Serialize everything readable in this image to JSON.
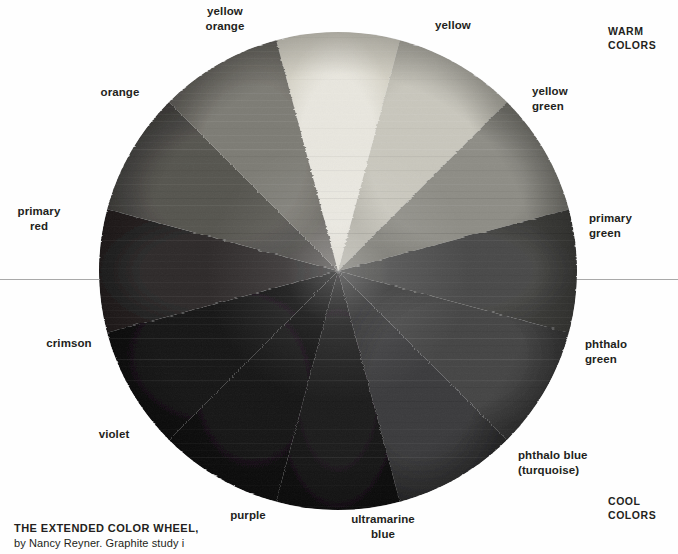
{
  "plate": {
    "background": "#fefefe",
    "rule_color": "#9a9a9a",
    "rule_y": 279
  },
  "caption": {
    "line1": "THE EXTENDED COLOR WHEEL,",
    "line2": "by Nancy Reyner. Graphite study i"
  },
  "groups": {
    "warm": "WARM\nCOLORS",
    "cool": "COOL\nCOLORS"
  },
  "chart_data": {
    "type": "pie",
    "title": "THE EXTENDED COLOR WHEEL,",
    "xlabel": "",
    "ylabel": "",
    "grid": false,
    "legend_position": "around-wheel",
    "center_x": 338,
    "center_y": 271,
    "radius": 240,
    "segment_count": 12,
    "segment_degrees": 30,
    "note": "Grayscale reproduction of a painted 12-hue color wheel; values are rendered tones.",
    "categories": [
      "yellow",
      "yellow green",
      "primary green",
      "phthalo green",
      "phthalo blue (turquoise)",
      "ultramarine blue",
      "purple",
      "violet",
      "crimson",
      "primary red",
      "orange",
      "yellow orange"
    ],
    "values": [
      30,
      30,
      30,
      30,
      30,
      30,
      30,
      30,
      30,
      30,
      30,
      30
    ],
    "segments": [
      {
        "label": "yellow",
        "start_deg": -15,
        "end_deg": 15,
        "tone": "#e9e7df",
        "tone_edge": "#d6d3c7"
      },
      {
        "label": "yellow green",
        "start_deg": 15,
        "end_deg": 45,
        "tone": "#c9c7bd",
        "tone_edge": "#b2b0a6"
      },
      {
        "label": "primary green",
        "start_deg": 45,
        "end_deg": 75,
        "tone": "#8e8d86",
        "tone_edge": "#76756e"
      },
      {
        "label": "phthalo green",
        "start_deg": 75,
        "end_deg": 105,
        "tone": "#4a4a48",
        "tone_edge": "#3a3a38"
      },
      {
        "label": "phthalo blue (turquoise)",
        "start_deg": 105,
        "end_deg": 135,
        "tone": "#454545",
        "tone_edge": "#343434"
      },
      {
        "label": "ultramarine blue",
        "start_deg": 135,
        "end_deg": 165,
        "tone": "#3b3b3c",
        "tone_edge": "#2b2b2c"
      },
      {
        "label": "purple",
        "start_deg": 165,
        "end_deg": 195,
        "tone": "#1b1a1b",
        "tone_edge": "#111011"
      },
      {
        "label": "violet",
        "start_deg": 195,
        "end_deg": 225,
        "tone": "#131213",
        "tone_edge": "#0b0a0b"
      },
      {
        "label": "crimson",
        "start_deg": 225,
        "end_deg": 255,
        "tone": "#161516",
        "tone_edge": "#0d0c0d"
      },
      {
        "label": "primary red",
        "start_deg": 255,
        "end_deg": 285,
        "tone": "#2e2c2c",
        "tone_edge": "#201f1f"
      },
      {
        "label": "orange",
        "start_deg": 285,
        "end_deg": 315,
        "tone": "#565450",
        "tone_edge": "#444340"
      },
      {
        "label": "yellow orange",
        "start_deg": 315,
        "end_deg": 345,
        "tone": "#7d7b74",
        "tone_edge": "#66645e"
      }
    ]
  },
  "labels": [
    {
      "name": "yellow",
      "text": "yellow",
      "x": 408,
      "y": 18,
      "w": 90,
      "align": "c"
    },
    {
      "name": "yellow-orange",
      "text": "yellow\norange",
      "x": 180,
      "y": 4,
      "w": 90,
      "align": "c"
    },
    {
      "name": "orange",
      "text": "orange",
      "x": 75,
      "y": 85,
      "w": 90,
      "align": "c"
    },
    {
      "name": "primary-red",
      "text": "primary\nred",
      "x": -6,
      "y": 204,
      "w": 90,
      "align": "c"
    },
    {
      "name": "crimson",
      "text": "crimson",
      "x": 24,
      "y": 336,
      "w": 90,
      "align": "c"
    },
    {
      "name": "violet",
      "text": "violet",
      "x": 69,
      "y": 427,
      "w": 90,
      "align": "c"
    },
    {
      "name": "purple",
      "text": "purple",
      "x": 203,
      "y": 508,
      "w": 90,
      "align": "c"
    },
    {
      "name": "ultramarine-blue",
      "text": "ultramarine\nblue",
      "x": 330,
      "y": 512,
      "w": 106,
      "align": "c"
    },
    {
      "name": "phthalo-blue-turquoise",
      "text": "phthalo blue\n(turquoise)",
      "x": 518,
      "y": 448,
      "w": 130,
      "align": "l"
    },
    {
      "name": "phthalo-green",
      "text": "phthalo\ngreen",
      "x": 585,
      "y": 337,
      "w": 90,
      "align": "l"
    },
    {
      "name": "primary-green",
      "text": "primary\ngreen",
      "x": 589,
      "y": 211,
      "w": 90,
      "align": "l"
    },
    {
      "name": "yellow-green",
      "text": "yellow\ngreen",
      "x": 532,
      "y": 84,
      "w": 90,
      "align": "l"
    }
  ]
}
